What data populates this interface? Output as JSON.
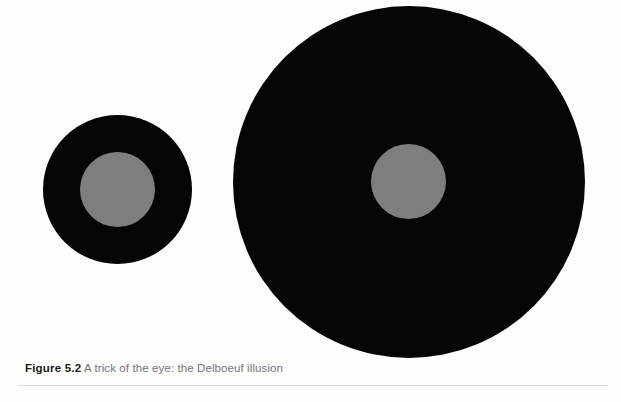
{
  "figure": {
    "caption_label": "Figure 5.2",
    "caption_text": " A trick of the eye: the Delboeuf illusion",
    "illusion_name": "Delboeuf illusion",
    "background_color": "#fdfdfc",
    "ring_color": "#050505",
    "inner_disc_color": "#7e7e7e",
    "rule_color": "#d8d9dd",
    "shapes": [
      {
        "name": "small-annulus",
        "outer_label": "small black ring",
        "inner_label": "gray inner disc",
        "outer_diameter_px": 149,
        "inner_diameter_px": 75,
        "center_x_px": 117,
        "center_y_px": 189
      },
      {
        "name": "large-annulus",
        "outer_label": "large black ring",
        "inner_label": "gray inner disc",
        "outer_diameter_px": 352,
        "inner_diameter_px": 75,
        "center_x_px": 409,
        "center_y_px": 182
      }
    ]
  }
}
